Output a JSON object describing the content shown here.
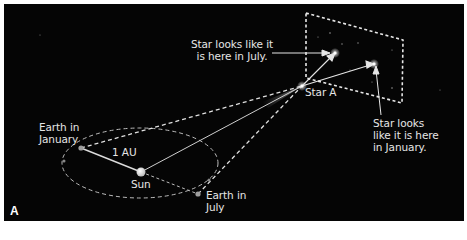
{
  "figure": {
    "panel_label": "A",
    "background_color": "#050505",
    "line_color": "#d8d8d8"
  },
  "labels": {
    "earth_january": [
      "Earth in",
      "January"
    ],
    "earth_july": [
      "Earth in",
      "July"
    ],
    "sun": "Sun",
    "distance": "1 AU",
    "star_a": "Star A",
    "july_image": [
      "Star looks like it",
      "is here in July."
    ],
    "january_image": [
      "Star looks",
      "like it is here",
      "in January."
    ]
  },
  "objects": {
    "sun": {
      "x": 141,
      "y": 172
    },
    "earth_january": {
      "x": 81,
      "y": 148
    },
    "earth_july": {
      "x": 198,
      "y": 194
    },
    "star_a": {
      "x": 302,
      "y": 86
    },
    "star_image_july": {
      "x": 335,
      "y": 53
    },
    "star_image_january": {
      "x": 374,
      "y": 64
    }
  }
}
